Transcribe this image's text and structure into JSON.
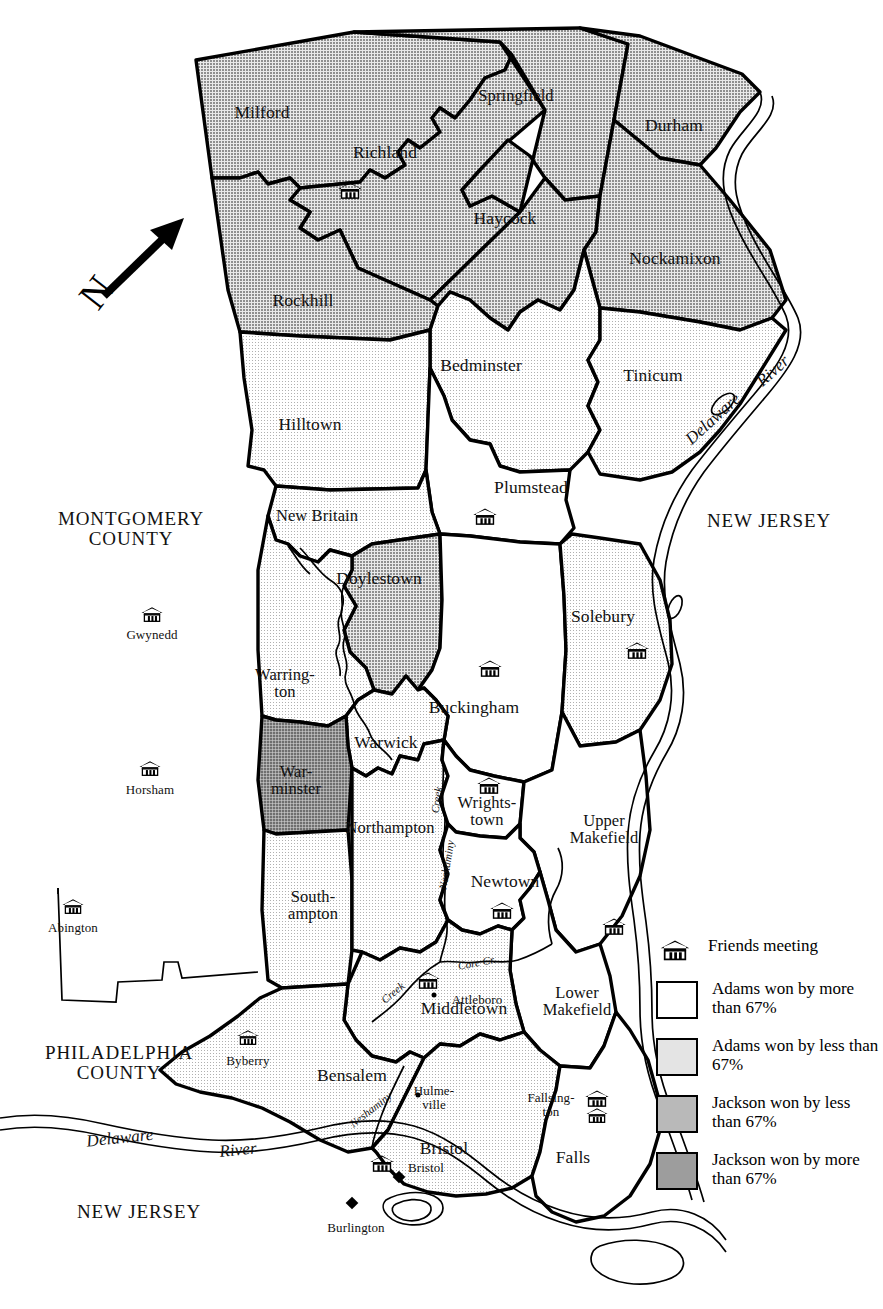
{
  "map": {
    "title": "Bucks County Pennsylvania election map",
    "north_arrow_label": "N",
    "colors": {
      "adams_more": "#ffffff",
      "adams_less": "#e4e4e4",
      "jackson_less": "#b9b9b9",
      "jackson_more": "#9d9d9d",
      "outline": "#000000"
    },
    "townships": [
      {
        "name": "Milford",
        "fill": "jackson_less",
        "x": 262,
        "y": 112,
        "meeting": false
      },
      {
        "name": "Richland",
        "fill": "jackson_less",
        "x": 385,
        "y": 152,
        "meeting": true,
        "mx": 350,
        "my": 192
      },
      {
        "name": "Springfield",
        "fill": "jackson_less",
        "x": 516,
        "y": 96,
        "meeting": false
      },
      {
        "name": "Durham",
        "fill": "jackson_less",
        "x": 674,
        "y": 125,
        "meeting": false
      },
      {
        "name": "Haycock",
        "fill": "jackson_less",
        "x": 505,
        "y": 218,
        "meeting": false
      },
      {
        "name": "Nockamixon",
        "fill": "jackson_less",
        "x": 675,
        "y": 258,
        "meeting": false
      },
      {
        "name": "Rockhill",
        "fill": "jackson_less",
        "x": 303,
        "y": 300,
        "meeting": false
      },
      {
        "name": "Bedminster",
        "fill": "adams_less",
        "x": 481,
        "y": 365,
        "meeting": false
      },
      {
        "name": "Tinicum",
        "fill": "adams_less",
        "x": 653,
        "y": 375,
        "meeting": false
      },
      {
        "name": "Hilltown",
        "fill": "adams_less",
        "x": 310,
        "y": 424,
        "meeting": false
      },
      {
        "name": "Plumstead",
        "fill": "adams_more",
        "x": 531,
        "y": 487,
        "meeting": true,
        "mx": 485,
        "my": 518
      },
      {
        "name": "New Britain",
        "fill": "adams_less",
        "x": 317,
        "y": 516,
        "meeting": false
      },
      {
        "name": "Doylestown",
        "fill": "jackson_less",
        "x": 379,
        "y": 578,
        "meeting": false
      },
      {
        "name": "Solebury",
        "fill": "adams_less",
        "x": 603,
        "y": 616,
        "meeting": true,
        "mx": 637,
        "my": 652
      },
      {
        "name": "Warring-\nton",
        "fill": "adams_less",
        "x": 285,
        "y": 683,
        "meeting": false
      },
      {
        "name": "Buckingham",
        "fill": "adams_more",
        "x": 474,
        "y": 707,
        "meeting": true,
        "mx": 490,
        "my": 670
      },
      {
        "name": "Warwick",
        "fill": "adams_less",
        "x": 386,
        "y": 742,
        "meeting": false
      },
      {
        "name": "War-\nminster",
        "fill": "jackson_more",
        "x": 296,
        "y": 780,
        "meeting": false
      },
      {
        "name": "Wrights-\ntown",
        "fill": "adams_more",
        "x": 487,
        "y": 811,
        "meeting": true,
        "mx": 489,
        "my": 787
      },
      {
        "name": "Upper\nMakefield",
        "fill": "adams_more",
        "x": 604,
        "y": 829,
        "meeting": true,
        "mx": 614,
        "my": 928
      },
      {
        "name": "Northampton",
        "fill": "adams_less",
        "x": 390,
        "y": 828,
        "meeting": false
      },
      {
        "name": "Newtown",
        "fill": "adams_more",
        "x": 505,
        "y": 881,
        "meeting": true,
        "mx": 502,
        "my": 912
      },
      {
        "name": "South-\nampton",
        "fill": "adams_less",
        "x": 313,
        "y": 905,
        "meeting": false
      },
      {
        "name": "Middletown",
        "fill": "adams_less",
        "x": 464,
        "y": 1008,
        "meeting": true,
        "mx": 428,
        "my": 982
      },
      {
        "name": "Lower\nMakefield",
        "fill": "adams_more",
        "x": 577,
        "y": 1001,
        "meeting": false
      },
      {
        "name": "Bensalem",
        "fill": "adams_less",
        "x": 352,
        "y": 1075,
        "meeting": false
      },
      {
        "name": "Bristol",
        "fill": "adams_less",
        "x": 444,
        "y": 1148,
        "meeting": true,
        "mx": 382,
        "my": 1165
      },
      {
        "name": "Falls",
        "fill": "adams_more",
        "x": 573,
        "y": 1157,
        "meeting": true,
        "mx": 597,
        "my": 1100
      }
    ],
    "places": [
      {
        "label": "Gwynedd",
        "x": 152,
        "y": 635,
        "meeting": true,
        "mx": 152,
        "my": 616,
        "type": "meeting"
      },
      {
        "label": "Horsham",
        "x": 150,
        "y": 790,
        "meeting": true,
        "mx": 150,
        "my": 770,
        "type": "meeting"
      },
      {
        "label": "Abington",
        "x": 73,
        "y": 928,
        "meeting": true,
        "mx": 73,
        "my": 908,
        "type": "meeting"
      },
      {
        "label": "Byberry",
        "x": 248,
        "y": 1061,
        "meeting": true,
        "mx": 248,
        "my": 1039,
        "type": "meeting"
      },
      {
        "label": "Attleboro",
        "x": 477,
        "y": 1000,
        "meeting": false,
        "type": "town",
        "dx": 434,
        "dy": 995
      },
      {
        "label": "Hulme-\nville",
        "x": 434,
        "y": 1098,
        "meeting": false,
        "type": "town",
        "dx": 418,
        "dy": 1095
      },
      {
        "label": "Fallsing-\nton",
        "x": 551,
        "y": 1105,
        "meeting": true,
        "mx": 597,
        "my": 1117,
        "type": "meeting-town"
      },
      {
        "label": "Bristol",
        "x": 426,
        "y": 1168,
        "meeting": false,
        "type": "town",
        "dx": 399,
        "dy": 1177
      },
      {
        "label": "Burlington",
        "x": 356,
        "y": 1228,
        "meeting": false,
        "type": "town",
        "dx": 352,
        "dy": 1203
      }
    ],
    "area_labels": [
      {
        "text": "MONTGOMERY\nCOUNTY",
        "x": 131,
        "y": 529,
        "style": "county"
      },
      {
        "text": "PHILADELPHIA\nCOUNTY",
        "x": 119,
        "y": 1063,
        "style": "county"
      },
      {
        "text": "NEW JERSEY",
        "x": 769,
        "y": 521,
        "style": "state"
      },
      {
        "text": "NEW JERSEY",
        "x": 139,
        "y": 1212,
        "style": "state"
      }
    ],
    "water_labels": [
      {
        "text": "Delaware",
        "x": 713,
        "y": 419,
        "rot": -42,
        "style": "river"
      },
      {
        "text": "River",
        "x": 773,
        "y": 371,
        "rot": -42,
        "style": "river"
      },
      {
        "text": "Delaware",
        "x": 120,
        "y": 1138,
        "rot": -6,
        "style": "river"
      },
      {
        "text": "River",
        "x": 238,
        "y": 1150,
        "rot": -6,
        "style": "river"
      },
      {
        "text": "Creek",
        "x": 437,
        "y": 800,
        "rot": -82,
        "style": "creek"
      },
      {
        "text": "Neshaminy",
        "x": 447,
        "y": 865,
        "rot": -81,
        "style": "creek"
      },
      {
        "text": "Core Cr.",
        "x": 477,
        "y": 963,
        "rot": -11,
        "style": "creek"
      },
      {
        "text": "Creek",
        "x": 393,
        "y": 993,
        "rot": -40,
        "style": "creek"
      },
      {
        "text": "Neshaminy",
        "x": 371,
        "y": 1110,
        "rot": -38,
        "style": "creek"
      }
    ]
  },
  "legend": {
    "items": [
      {
        "label": "Friends meeting",
        "symbol": "meeting-house-icon",
        "fill": null
      },
      {
        "label": "Adams won by\nmore than 67%",
        "symbol": "swatch",
        "fill": "adams_more"
      },
      {
        "label": "Adams won by\nless than 67%",
        "symbol": "swatch",
        "fill": "adams_less"
      },
      {
        "label": "Jackson won by\nless than 67%",
        "symbol": "swatch",
        "fill": "jackson_less"
      },
      {
        "label": "Jackson won by\nmore than 67%",
        "symbol": "swatch",
        "fill": "jackson_more"
      }
    ]
  },
  "caption": ""
}
